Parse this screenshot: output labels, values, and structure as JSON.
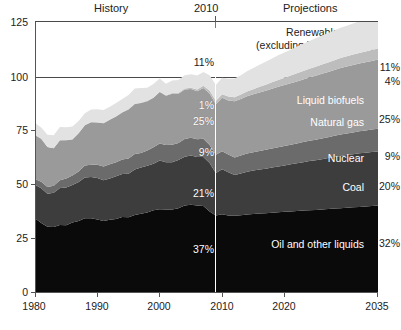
{
  "header": {
    "history_label": "History",
    "divider_year_label": "2010",
    "projections_label": "Projections"
  },
  "annotations": {
    "renewables_line1": "Renewables",
    "renewables_line2": "(excluding liquid biofuels)"
  },
  "axes": {
    "y_ticks": [
      "0",
      "25",
      "50",
      "75",
      "100",
      "125"
    ],
    "y_min": 0,
    "y_max": 125,
    "x_ticks": [
      "1980",
      "1990",
      "2000",
      "2010",
      "2020",
      "2035"
    ],
    "x_min": 1980,
    "x_max": 2035,
    "gridline_values": [
      100,
      125
    ]
  },
  "chart_data": {
    "type": "area",
    "title": "",
    "subtitle": "",
    "xlabel": "",
    "ylabel": "",
    "xlim": [
      1980,
      2035
    ],
    "ylim": [
      0,
      125
    ],
    "grid": false,
    "stacked": true,
    "legend_position": "inline-right",
    "divider_year": 2010,
    "x": [
      1980,
      1981,
      1982,
      1983,
      1984,
      1985,
      1986,
      1987,
      1988,
      1989,
      1990,
      1991,
      1992,
      1993,
      1994,
      1995,
      1996,
      1997,
      1998,
      1999,
      2000,
      2001,
      2002,
      2003,
      2004,
      2005,
      2006,
      2007,
      2008,
      2009,
      2010,
      2011,
      2012,
      2013,
      2014,
      2015,
      2016,
      2017,
      2018,
      2019,
      2020,
      2021,
      2022,
      2023,
      2024,
      2025,
      2026,
      2027,
      2028,
      2029,
      2030,
      2031,
      2032,
      2033,
      2034,
      2035
    ],
    "series": [
      {
        "name": "Oil and other liquids",
        "color": "#0a0a0a",
        "label_color": "#ffffff",
        "mid_pct": "37%",
        "right_pct": "32%",
        "values": [
          34.2,
          32.0,
          30.2,
          30.1,
          31.0,
          30.9,
          32.2,
          32.9,
          34.2,
          34.2,
          33.6,
          32.9,
          33.5,
          33.8,
          34.7,
          34.6,
          35.7,
          36.2,
          36.8,
          37.8,
          38.3,
          38.2,
          38.2,
          38.8,
          40.1,
          40.4,
          40.0,
          39.8,
          37.3,
          35.4,
          36.0,
          35.4,
          35.3,
          35.5,
          35.9,
          36.1,
          36.3,
          36.5,
          36.7,
          36.9,
          37.1,
          37.3,
          37.5,
          37.7,
          37.9,
          38.0,
          38.2,
          38.4,
          38.6,
          38.8,
          39.0,
          39.2,
          39.4,
          39.6,
          39.8,
          40.0
        ]
      },
      {
        "name": "Coal",
        "color": "#3d3d3d",
        "label_color": "#ffffff",
        "mid_pct": "21%",
        "right_pct": "20%",
        "values": [
          15.4,
          16.0,
          15.3,
          15.9,
          17.1,
          17.5,
          17.3,
          18.0,
          18.8,
          19.0,
          19.2,
          18.8,
          19.1,
          19.8,
          19.9,
          20.1,
          21.0,
          21.4,
          21.6,
          21.6,
          22.6,
          21.9,
          21.9,
          22.3,
          22.5,
          22.8,
          22.5,
          22.7,
          22.4,
          19.7,
          20.8,
          20.0,
          18.9,
          19.4,
          19.8,
          20.1,
          20.4,
          20.6,
          20.9,
          21.2,
          21.5,
          21.8,
          22.1,
          22.4,
          22.7,
          23.0,
          23.3,
          23.6,
          23.9,
          24.2,
          24.4,
          24.6,
          24.8,
          24.9,
          25.0,
          25.1
        ]
      },
      {
        "name": "Nuclear",
        "color": "#6b6b6b",
        "label_color": "#ffffff",
        "mid_pct": "9%",
        "right_pct": "9%",
        "values": [
          2.7,
          3.0,
          3.1,
          3.2,
          3.6,
          4.1,
          4.4,
          4.9,
          5.6,
          5.7,
          6.1,
          6.4,
          6.5,
          6.5,
          6.8,
          7.1,
          7.2,
          6.7,
          7.1,
          7.6,
          7.9,
          8.0,
          8.1,
          7.9,
          8.2,
          8.2,
          8.2,
          8.4,
          8.4,
          8.4,
          8.4,
          8.3,
          8.1,
          8.3,
          8.4,
          8.5,
          8.6,
          8.7,
          8.8,
          8.9,
          9.0,
          9.1,
          9.2,
          9.3,
          9.4,
          9.5,
          9.6,
          9.7,
          9.8,
          9.9,
          10.0,
          10.1,
          10.2,
          10.3,
          10.4,
          10.5
        ]
      },
      {
        "name": "Natural gas",
        "color": "#9a9a9a",
        "label_color": "#ffffff",
        "mid_pct": "25%",
        "right_pct": "25%",
        "values": [
          20.4,
          19.9,
          18.5,
          17.4,
          18.5,
          17.8,
          16.7,
          17.7,
          18.6,
          19.7,
          19.6,
          20.0,
          20.7,
          21.2,
          21.7,
          22.7,
          23.1,
          23.2,
          22.8,
          22.9,
          23.8,
          22.8,
          23.6,
          22.8,
          22.9,
          22.6,
          22.2,
          23.6,
          23.8,
          23.4,
          24.7,
          25.0,
          26.0,
          26.2,
          26.5,
          26.8,
          27.1,
          27.4,
          27.7,
          28.0,
          28.2,
          28.4,
          28.7,
          29.0,
          29.3,
          29.6,
          29.9,
          30.2,
          30.5,
          30.8,
          31.0,
          31.2,
          31.4,
          31.6,
          31.8,
          32.0
        ]
      },
      {
        "name": "Liquid biofuels",
        "color": "#bdbdbd",
        "label_color": "#ffffff",
        "mid_pct": "1%",
        "right_pct": "4%",
        "values": [
          0.0,
          0.0,
          0.0,
          0.0,
          0.1,
          0.1,
          0.1,
          0.1,
          0.1,
          0.1,
          0.1,
          0.1,
          0.1,
          0.1,
          0.2,
          0.2,
          0.2,
          0.2,
          0.2,
          0.2,
          0.2,
          0.2,
          0.3,
          0.4,
          0.5,
          0.6,
          0.8,
          1.0,
          1.4,
          1.5,
          1.6,
          1.8,
          1.9,
          2.0,
          2.2,
          2.4,
          2.6,
          2.8,
          3.0,
          3.2,
          3.4,
          3.6,
          3.8,
          3.9,
          4.0,
          4.2,
          4.3,
          4.4,
          4.5,
          4.6,
          4.7,
          4.8,
          4.9,
          5.0,
          5.0,
          5.1
        ]
      },
      {
        "name": "Renewables (excluding liquid biofuels)",
        "color": "#e2e2e2",
        "label_color": "#222222",
        "mid_pct": "11%",
        "right_pct": "11%",
        "values": [
          5.5,
          5.2,
          5.7,
          6.0,
          6.1,
          5.9,
          5.9,
          5.6,
          5.4,
          5.8,
          6.0,
          6.1,
          5.9,
          6.1,
          6.1,
          6.5,
          7.0,
          6.7,
          6.1,
          6.2,
          6.1,
          5.3,
          5.8,
          6.0,
          6.1,
          6.2,
          6.5,
          6.4,
          7.0,
          7.4,
          7.7,
          8.2,
          8.6,
          9.0,
          9.4,
          9.8,
          10.2,
          10.6,
          11.0,
          11.4,
          11.7,
          12.0,
          12.3,
          12.6,
          12.9,
          13.2,
          13.4,
          13.6,
          13.8,
          14.0,
          14.2,
          14.4,
          14.6,
          14.7,
          14.8,
          14.9
        ]
      }
    ]
  }
}
